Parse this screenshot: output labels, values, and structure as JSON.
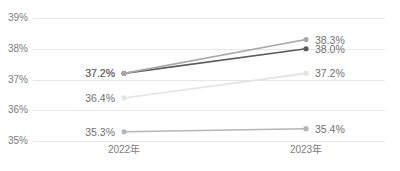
{
  "chart_data": {
    "type": "line",
    "title": "",
    "xlabel": "",
    "ylabel": "",
    "categories": [
      "2022年",
      "2023年"
    ],
    "ylim": [
      35,
      39
    ],
    "ytick_labels": [
      "39%",
      "38%",
      "37%",
      "36%",
      "35%"
    ],
    "ytick_values": [
      39,
      38,
      37,
      36,
      35
    ],
    "grid": true,
    "legend_position": "top",
    "legend_truncated": true,
    "series": [
      {
        "name": "",
        "color": "#5a5a5a",
        "values": [
          37.2,
          38.0
        ],
        "labels": [
          "37.2%",
          "38.0%"
        ]
      },
      {
        "name": "",
        "color": "#a8a8a8",
        "values": [
          37.2,
          38.3
        ],
        "labels": [
          "37.2%",
          "38.3%"
        ]
      },
      {
        "name": "",
        "color": "#e3e3e3",
        "values": [
          36.4,
          37.2
        ],
        "labels": [
          "36.4%",
          "37.2%"
        ]
      },
      {
        "name": "",
        "color": "#b5b5b5",
        "values": [
          35.3,
          35.4
        ],
        "labels": [
          "35.3%",
          "35.4%"
        ]
      }
    ]
  },
  "legend": {
    "items": [
      {
        "label": "",
        "color": "#5a5a5a"
      },
      {
        "label": "",
        "color": "#a8a8a8"
      },
      {
        "label": "",
        "color": "#e3e3e3"
      },
      {
        "label": "",
        "color": "#b5b5b5"
      }
    ]
  },
  "colors": {
    "gridline": "#e6e6e6",
    "tick_text": "#7d7d7d",
    "label_text": "#6f6f6f",
    "background": "#ffffff"
  }
}
